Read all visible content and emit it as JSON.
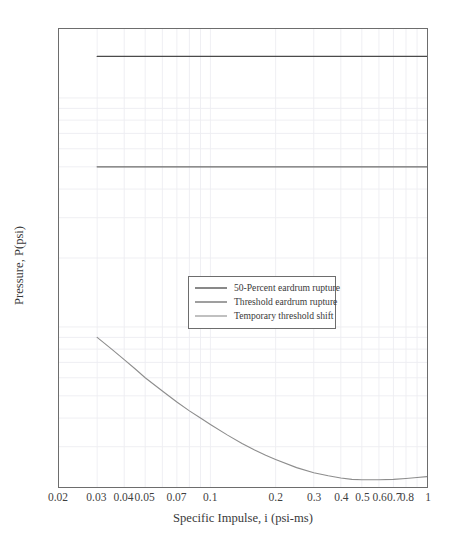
{
  "chart_data": {
    "type": "line",
    "title": "",
    "xlabel": "Specific Impulse, i (psi-ms)",
    "ylabel": "Pressure, P(psi)",
    "xscale": "log",
    "yscale": "log",
    "xlim": [
      0.02,
      1.0
    ],
    "ylim": [
      0.2,
      20
    ],
    "grid": true,
    "legend_position": "center",
    "xticks": [
      0.02,
      0.03,
      0.04,
      0.05,
      0.07,
      0.1,
      0.2,
      0.3,
      0.4,
      0.5,
      0.6,
      0.7,
      0.8,
      1
    ],
    "xticklabels": [
      "0.02",
      "0.03",
      "0.04",
      "0.05",
      "0.07",
      "0.1",
      "0.2",
      "0.3",
      "0.4",
      "0.5",
      "0.6",
      "0.7",
      "0.8",
      "1"
    ],
    "yticks": [
      0.2,
      0.3,
      0.4,
      0.5,
      0.6,
      0.7,
      0.8,
      0.9,
      1,
      2,
      3,
      4,
      5,
      6,
      7,
      8,
      9,
      10,
      20
    ],
    "yticklabels": [
      "0.2",
      "0.3",
      "0.4",
      "0.5",
      "0.6",
      "0.7",
      "0.8",
      "0.9",
      "1",
      "2",
      "3",
      "4",
      "5",
      "6",
      "7",
      "8",
      "9",
      "10",
      "20"
    ],
    "series": [
      {
        "name": "50-Percent eardrum rupture",
        "color": "#4a4a4a",
        "linestyle": "solid",
        "linewidth": 1.3,
        "x": [
          0.03,
          0.04,
          0.05,
          0.07,
          0.1,
          0.15,
          0.2,
          0.3,
          0.4,
          0.5,
          0.7,
          1.0
        ],
        "y": [
          15.2,
          15.2,
          15.2,
          15.2,
          15.2,
          15.2,
          15.2,
          15.2,
          15.2,
          15.2,
          15.2,
          15.2
        ]
      },
      {
        "name": "Threshold eardrum rupture",
        "color": "#6b6b6b",
        "linestyle": "solid",
        "linewidth": 1.3,
        "x": [
          0.03,
          0.04,
          0.05,
          0.07,
          0.1,
          0.15,
          0.2,
          0.3,
          0.4,
          0.5,
          0.7,
          1.0
        ],
        "y": [
          5.0,
          5.0,
          5.0,
          5.0,
          5.0,
          5.0,
          5.0,
          5.0,
          5.0,
          5.0,
          5.0,
          5.0
        ]
      },
      {
        "name": "Temporary threshold shift",
        "color": "#8d8d8d",
        "linestyle": "solid",
        "linewidth": 1.1,
        "x": [
          0.03,
          0.035,
          0.04,
          0.045,
          0.05,
          0.06,
          0.07,
          0.08,
          0.09,
          0.1,
          0.12,
          0.14,
          0.16,
          0.18,
          0.2,
          0.25,
          0.3,
          0.35,
          0.4,
          0.45,
          0.5,
          0.6,
          0.7,
          0.8,
          0.9,
          1.0
        ],
        "y": [
          0.9,
          0.8,
          0.72,
          0.655,
          0.6,
          0.525,
          0.47,
          0.43,
          0.4,
          0.375,
          0.337,
          0.31,
          0.29,
          0.275,
          0.264,
          0.243,
          0.231,
          0.224,
          0.219,
          0.216,
          0.215,
          0.215,
          0.216,
          0.218,
          0.22,
          0.222
        ]
      }
    ]
  },
  "legend": {
    "entries": [
      {
        "label": "50-Percent eardrum rupture"
      },
      {
        "label": "Threshold eardrum rupture"
      },
      {
        "label": "Temporary threshold shift"
      }
    ]
  },
  "colors": {
    "axis": "#6d6d6d",
    "grid": "#ededf2",
    "text": "#3a3a3a",
    "background": "#ffffff"
  },
  "bottom_caption": ""
}
